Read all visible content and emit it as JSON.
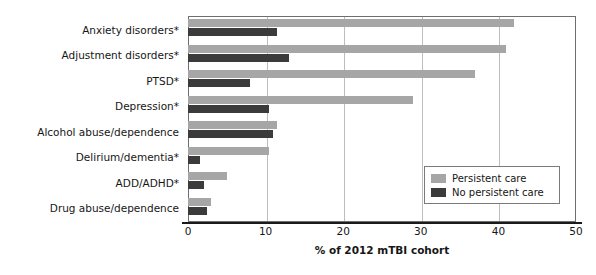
{
  "chart_data": {
    "type": "bar",
    "orientation": "horizontal",
    "title": "",
    "xlabel": "% of 2012 mTBI cohort",
    "ylabel": "",
    "xlim": [
      0,
      50
    ],
    "xticks": [
      0,
      10,
      20,
      30,
      40,
      50
    ],
    "grid": true,
    "legend_position": "lower-right",
    "categories": [
      "Anxiety disorders*",
      "Adjustment disorders*",
      "PTSD*",
      "Depression*",
      "Alcohol abuse/dependence",
      "Delirium/dementia*",
      "ADD/ADHD*",
      "Drug abuse/dependence"
    ],
    "series": [
      {
        "name": "Persistent care",
        "color": "#a6a6a6",
        "values": [
          42.0,
          41.0,
          37.0,
          29.0,
          11.5,
          10.5,
          5.0,
          3.0
        ]
      },
      {
        "name": "No persistent care",
        "color": "#3b3b3b",
        "values": [
          11.5,
          13.0,
          8.0,
          10.5,
          11.0,
          1.5,
          2.0,
          2.5
        ]
      }
    ]
  },
  "axis": {
    "tick_labels": [
      "0",
      "10",
      "20",
      "30",
      "40",
      "50"
    ],
    "x_title": "% of 2012 mTBI cohort"
  },
  "legend": {
    "items": [
      {
        "label": "Persistent care",
        "swatch": "legend-swatch-light"
      },
      {
        "label": "No persistent care",
        "swatch": "legend-swatch-dark"
      }
    ]
  },
  "colors": {
    "persistent_care": "#a6a6a6",
    "no_persistent_care": "#3b3b3b",
    "gridline": "#bdbdbd",
    "axis": "#1a1a1a",
    "frame": "#6e6e6e"
  }
}
